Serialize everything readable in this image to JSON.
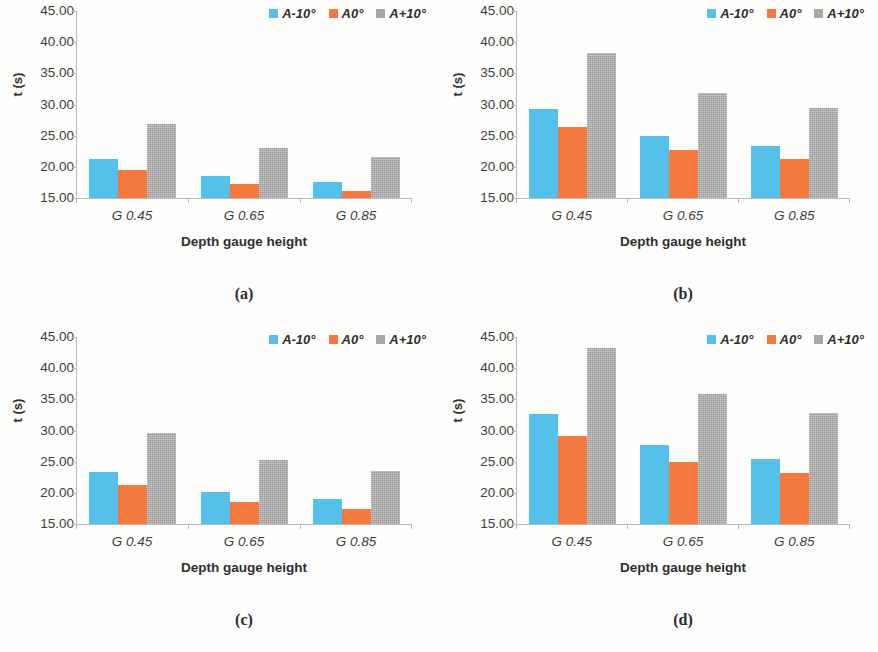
{
  "figure": {
    "background": "#fdfdfb",
    "series_colors": {
      "A-10": "#55c1ea",
      "A0": "#f4793e",
      "A+10": "#a8a8a8"
    }
  },
  "common": {
    "ylabel": "t (s)",
    "xlabel": "Depth gauge height",
    "categories": [
      "G 0.45",
      "G 0.65",
      "G 0.85"
    ],
    "yticks": [
      "15.00",
      "20.00",
      "25.00",
      "30.00",
      "35.00",
      "40.00",
      "45.00"
    ],
    "ytick_values": [
      15,
      20,
      25,
      30,
      35,
      40,
      45
    ],
    "legend": [
      {
        "label": "A-10°",
        "color": "#55c1ea"
      },
      {
        "label": "A0°",
        "color": "#f4793e"
      },
      {
        "label": "A+10°",
        "color": "#a8a8a8"
      }
    ]
  },
  "panels": [
    {
      "caption": "(a)"
    },
    {
      "caption": "(b)"
    },
    {
      "caption": "(c)"
    },
    {
      "caption": "(d)"
    }
  ],
  "chart_data": [
    {
      "type": "bar",
      "title": "(a)",
      "xlabel": "Depth gauge height",
      "ylabel": "t (s)",
      "ylim": [
        15,
        45
      ],
      "yticks": [
        15,
        20,
        25,
        30,
        35,
        40,
        45
      ],
      "grid": false,
      "legend_position": "top-right",
      "categories": [
        "G 0.45",
        "G 0.65",
        "G 0.85"
      ],
      "series": [
        {
          "name": "A-10°",
          "color": "#55c1ea",
          "values": [
            21.3,
            18.6,
            17.5
          ]
        },
        {
          "name": "A0°",
          "color": "#f4793e",
          "values": [
            19.5,
            17.2,
            16.2
          ]
        },
        {
          "name": "A+10°",
          "color": "#a8a8a8",
          "values": [
            26.8,
            23.0,
            21.5
          ]
        }
      ]
    },
    {
      "type": "bar",
      "title": "(b)",
      "xlabel": "Depth gauge height",
      "ylabel": "t (s)",
      "ylim": [
        15,
        45
      ],
      "yticks": [
        15,
        20,
        25,
        30,
        35,
        40,
        45
      ],
      "grid": false,
      "legend_position": "top-right",
      "categories": [
        "G 0.45",
        "G 0.65",
        "G 0.85"
      ],
      "series": [
        {
          "name": "A-10°",
          "color": "#55c1ea",
          "values": [
            29.3,
            25.0,
            23.3
          ]
        },
        {
          "name": "A0°",
          "color": "#f4793e",
          "values": [
            26.4,
            22.7,
            21.2
          ]
        },
        {
          "name": "A+10°",
          "color": "#a8a8a8",
          "values": [
            38.3,
            31.9,
            29.4
          ]
        }
      ]
    },
    {
      "type": "bar",
      "title": "(c)",
      "xlabel": "Depth gauge height",
      "ylabel": "t (s)",
      "ylim": [
        15,
        45
      ],
      "yticks": [
        15,
        20,
        25,
        30,
        35,
        40,
        45
      ],
      "grid": false,
      "legend_position": "top-right",
      "categories": [
        "G 0.45",
        "G 0.65",
        "G 0.85"
      ],
      "series": [
        {
          "name": "A-10°",
          "color": "#55c1ea",
          "values": [
            23.3,
            20.2,
            19.0
          ]
        },
        {
          "name": "A0°",
          "color": "#f4793e",
          "values": [
            21.2,
            18.6,
            17.4
          ]
        },
        {
          "name": "A+10°",
          "color": "#a8a8a8",
          "values": [
            29.6,
            25.2,
            23.5
          ]
        }
      ]
    },
    {
      "type": "bar",
      "title": "(d)",
      "xlabel": "Depth gauge height",
      "ylabel": "t (s)",
      "ylim": [
        15,
        45
      ],
      "yticks": [
        15,
        20,
        25,
        30,
        35,
        40,
        45
      ],
      "grid": false,
      "legend_position": "top-right",
      "categories": [
        "G 0.45",
        "G 0.65",
        "G 0.85"
      ],
      "series": [
        {
          "name": "A-10°",
          "color": "#55c1ea",
          "values": [
            32.7,
            27.6,
            25.5
          ]
        },
        {
          "name": "A0°",
          "color": "#f4793e",
          "values": [
            29.2,
            25.0,
            23.2
          ]
        },
        {
          "name": "A+10°",
          "color": "#a8a8a8",
          "values": [
            43.3,
            35.8,
            32.8
          ]
        }
      ]
    }
  ]
}
